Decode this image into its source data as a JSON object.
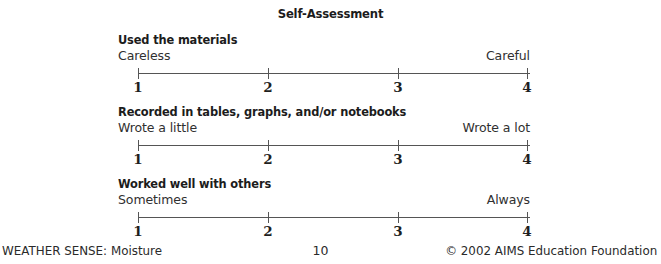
{
  "page": {
    "title": "Self-Assessment",
    "background_color": "#ffffff",
    "text_color": "#242424",
    "line_color": "#555555"
  },
  "scales": [
    {
      "heading": "Used the materials",
      "left_anchor": "Careless",
      "right_anchor": "Careful",
      "ticks": [
        "1",
        "2",
        "3",
        "4"
      ]
    },
    {
      "heading": "Recorded in tables, graphs, and/or notebooks",
      "left_anchor": "Wrote a little",
      "right_anchor": "Wrote a lot",
      "ticks": [
        "1",
        "2",
        "3",
        "4"
      ]
    },
    {
      "heading": "Worked well with others",
      "left_anchor": "Sometimes",
      "right_anchor": "Always",
      "ticks": [
        "1",
        "2",
        "3",
        "4"
      ]
    }
  ],
  "footer": {
    "book_title": "WEATHER SENSE:",
    "book_subtitle": "Moisture",
    "page_number": "10",
    "copyright": "© 2002 AIMS Education Foundation"
  }
}
